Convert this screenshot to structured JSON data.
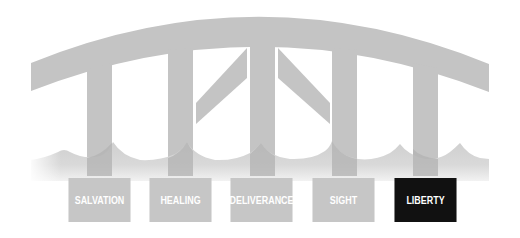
{
  "diagram": {
    "type": "bridge-illustration",
    "colors": {
      "structure": "#c4c4c4",
      "structure_dark": "#b3b3b3",
      "water": "#d2d2d2",
      "label_default": "#c6c6c6",
      "label_active": "#111111",
      "label_text": "#ffffff"
    },
    "labels": [
      {
        "text": "SALVATION",
        "active": false
      },
      {
        "text": "HEALING",
        "active": false
      },
      {
        "text": "DELIVERANCE",
        "active": false
      },
      {
        "text": "SIGHT",
        "active": false
      },
      {
        "text": "LIBERTY",
        "active": true
      }
    ]
  }
}
